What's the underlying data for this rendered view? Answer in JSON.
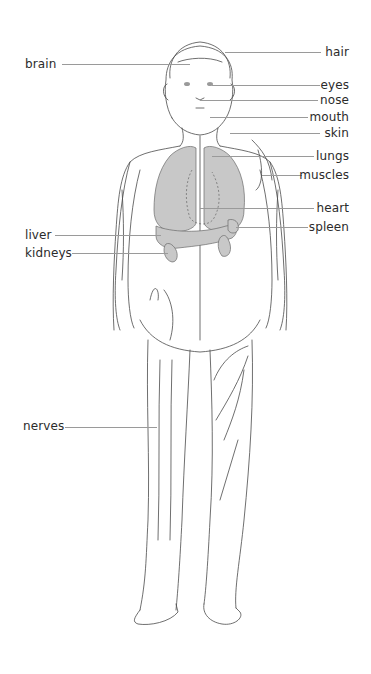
{
  "diagram": {
    "colors": {
      "outline": "#4a4a4a",
      "organ_fill": "#c8c8c8",
      "leader_line": "#9a9a9a",
      "label_text": "#2b2b2b",
      "background": "#ffffff"
    },
    "labels_left": [
      {
        "id": "brain",
        "text": "brain"
      },
      {
        "id": "liver",
        "text": "liver"
      },
      {
        "id": "kidneys",
        "text": "kidneys"
      },
      {
        "id": "nerves",
        "text": "nerves"
      }
    ],
    "labels_right": [
      {
        "id": "hair",
        "text": "hair"
      },
      {
        "id": "eyes",
        "text": "eyes"
      },
      {
        "id": "nose",
        "text": "nose"
      },
      {
        "id": "mouth",
        "text": "mouth"
      },
      {
        "id": "skin",
        "text": "skin"
      },
      {
        "id": "lungs",
        "text": "lungs"
      },
      {
        "id": "muscles",
        "text": "muscles"
      },
      {
        "id": "heart",
        "text": "heart"
      },
      {
        "id": "spleen",
        "text": "spleen"
      }
    ]
  }
}
